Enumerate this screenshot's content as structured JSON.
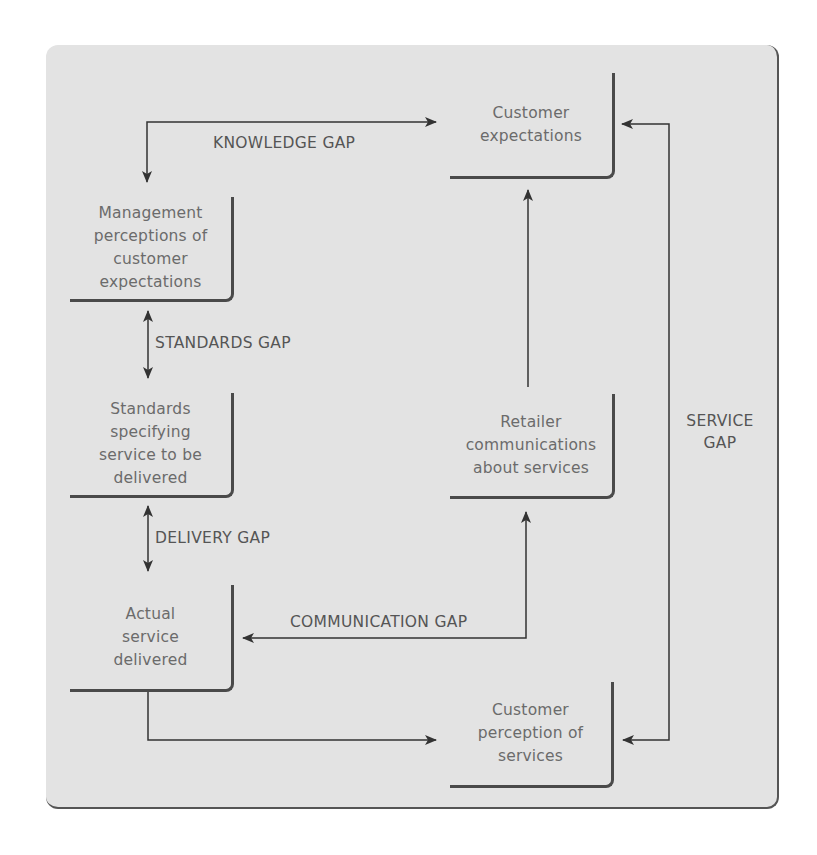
{
  "diagram": {
    "title": "",
    "boxes": {
      "customer_expectations": {
        "lines": [
          "Customer",
          "expectations"
        ]
      },
      "management_perceptions": {
        "lines": [
          "Management",
          "perceptions of",
          "customer",
          "expectations"
        ]
      },
      "standards": {
        "lines": [
          "Standards",
          "specifying",
          "service to be",
          "delivered"
        ]
      },
      "actual_service": {
        "lines": [
          "Actual",
          "service",
          "delivered"
        ]
      },
      "retailer_communications": {
        "lines": [
          "Retailer",
          "communications",
          "about services"
        ]
      },
      "customer_perception": {
        "lines": [
          "Customer",
          "perception of",
          "services"
        ]
      }
    },
    "gaps": {
      "knowledge": "KNOWLEDGE GAP",
      "standards": "STANDARDS GAP",
      "delivery": "DELIVERY GAP",
      "communication": "COMMUNICATION GAP",
      "service_line1": "SERVICE",
      "service_line2": "GAP"
    },
    "colors": {
      "panel": "#e3e3e3",
      "line": "#3a3a3a",
      "text": "#6b6b6b"
    }
  }
}
